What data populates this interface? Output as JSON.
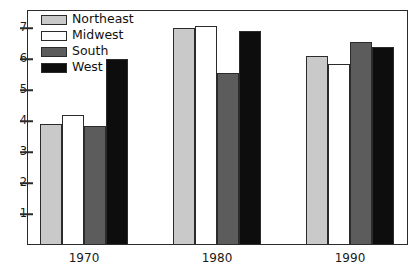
{
  "chart_data": {
    "type": "bar",
    "title": "",
    "xlabel": "",
    "ylabel": "",
    "categories": [
      "1970",
      "1980",
      "1990"
    ],
    "series": [
      {
        "name": "Northeast",
        "color": "#c9c9c9",
        "values": [
          3.9,
          7.0,
          6.1
        ]
      },
      {
        "name": "Midwest",
        "color": "#ffffff",
        "values": [
          4.2,
          7.05,
          5.85
        ]
      },
      {
        "name": "South",
        "color": "#5c5c5c",
        "values": [
          3.85,
          5.55,
          6.55
        ]
      },
      {
        "name": "West",
        "color": "#0d0d0d",
        "values": [
          6.0,
          6.9,
          6.4
        ]
      }
    ],
    "ylim": [
      0,
      7.6
    ],
    "yticks": [
      1,
      2,
      3,
      4,
      5,
      6,
      7
    ],
    "ytick_labels": [
      "1",
      "2",
      "3",
      "4",
      "5",
      "6",
      "7"
    ],
    "grid": false,
    "legend_position": "top-left",
    "frame": true
  },
  "legend": {
    "items": [
      {
        "label": "Northeast",
        "swatch": "#c9c9c9"
      },
      {
        "label": "Midwest",
        "swatch": "#ffffff"
      },
      {
        "label": "South",
        "swatch": "#5c5c5c"
      },
      {
        "label": "West",
        "swatch": "#0d0d0d"
      }
    ]
  },
  "axes": {
    "y_tick_labels": [
      "7",
      "6",
      "5",
      "4",
      "3",
      "2",
      "1"
    ],
    "x_tick_labels": [
      "1970",
      "1980",
      "1990"
    ]
  }
}
